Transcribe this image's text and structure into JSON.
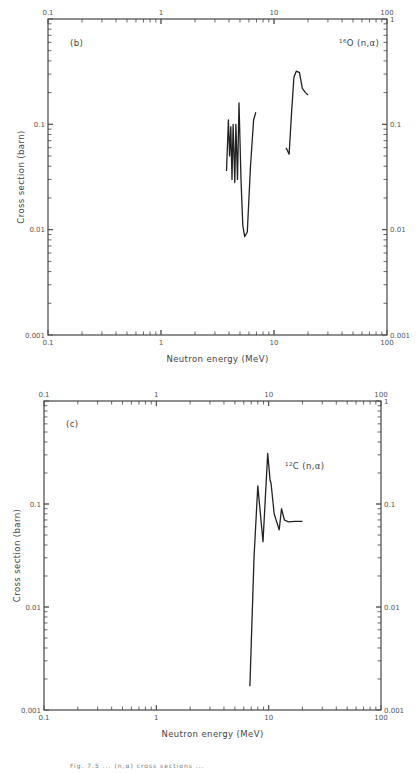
{
  "panels": {
    "b": {
      "panel_label": "(b)",
      "reaction_label_sup": "16",
      "reaction_label_main": "O (n,α)",
      "xlabel": "Neutron energy (MeV)",
      "ylabel": "Cross section (barn)"
    },
    "c": {
      "panel_label": "(c)",
      "reaction_label_sup": "12",
      "reaction_label_main": "C (n,α)",
      "xlabel": "Neutron energy (MeV)",
      "ylabel": "Cross section (barn)"
    }
  },
  "x_ticks": [
    "0.1",
    "1",
    "10",
    "100"
  ],
  "y_ticks": [
    "1",
    "0.1",
    "0.01",
    "0.001"
  ],
  "caption": "Fig. 7.5 ... (n,α) cross sections ...",
  "chart_data": [
    {
      "type": "line",
      "title": "(b) 16O(n,α)",
      "xlabel": "Neutron energy (MeV)",
      "ylabel": "Cross section (barn)",
      "xscale": "log",
      "yscale": "log",
      "xlim": [
        0.1,
        100
      ],
      "ylim": [
        0.001,
        1
      ],
      "x_tick_labels": [
        "0.1",
        "1",
        "10",
        "100"
      ],
      "y_tick_labels": [
        "0.001",
        "0.01",
        "0.1",
        "1"
      ],
      "grid": false,
      "annotations": [
        "(b)",
        "16O (n,α)"
      ],
      "series": [
        {
          "name": "16O(n,α) segment 1",
          "x": [
            3.8,
            3.95,
            4.05,
            4.15,
            4.25,
            4.35,
            4.5,
            4.6,
            4.75,
            4.9,
            5.1,
            5.3,
            5.5,
            5.8,
            6.2,
            6.6,
            6.9
          ],
          "y": [
            0.036,
            0.11,
            0.05,
            0.095,
            0.03,
            0.1,
            0.028,
            0.1,
            0.03,
            0.16,
            0.03,
            0.011,
            0.0086,
            0.0095,
            0.04,
            0.11,
            0.13
          ]
        },
        {
          "name": "16O(n,α) segment 2",
          "x": [
            12.8,
            13.6,
            14.3,
            15.0,
            15.8,
            16.8,
            17.8,
            19.0,
            20.0
          ],
          "y": [
            0.06,
            0.052,
            0.13,
            0.28,
            0.32,
            0.31,
            0.22,
            0.2,
            0.19
          ]
        }
      ]
    },
    {
      "type": "line",
      "title": "(c) 12C(n,α)",
      "xlabel": "Neutron energy (MeV)",
      "ylabel": "Cross section (barn)",
      "xscale": "log",
      "yscale": "log",
      "xlim": [
        0.1,
        100
      ],
      "ylim": [
        0.001,
        1
      ],
      "x_tick_labels": [
        "0.1",
        "1",
        "10",
        "100"
      ],
      "y_tick_labels": [
        "0.001",
        "0.01",
        "0.1",
        "1"
      ],
      "grid": false,
      "annotations": [
        "(c)",
        "12C (n,α)"
      ],
      "series": [
        {
          "name": "12C(n,α)",
          "x": [
            6.8,
            7.4,
            8.0,
            8.9,
            9.8,
            10.3,
            10.5,
            11.2,
            12.4,
            13.0,
            13.8,
            15.0,
            17.0,
            20.0
          ],
          "y": [
            0.0017,
            0.03,
            0.15,
            0.043,
            0.31,
            0.17,
            0.16,
            0.08,
            0.056,
            0.09,
            0.07,
            0.067,
            0.068,
            0.068
          ]
        }
      ]
    }
  ]
}
